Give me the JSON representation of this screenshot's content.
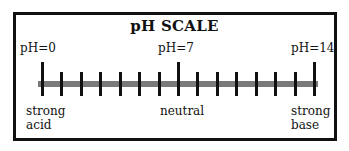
{
  "title": "pH SCALE",
  "top_labels": [
    {
      "text": "pH=0",
      "x": 20
    },
    {
      "text": "pH=7",
      "x": 158
    },
    {
      "text": "pH=14",
      "x": 291
    }
  ],
  "bottom_labels": [
    {
      "line1": "strong",
      "line2": "acid",
      "x": 26
    },
    {
      "line1": "neutral",
      "line2": "",
      "x": 160
    },
    {
      "line1": "strong",
      "line2": "base",
      "x": 291
    }
  ],
  "scale": {
    "min": 0,
    "max": 14,
    "major_ticks": [
      0,
      7,
      14
    ],
    "tick_count": 15,
    "bar_color": "#7a7a7a",
    "tick_color": "#111111"
  }
}
